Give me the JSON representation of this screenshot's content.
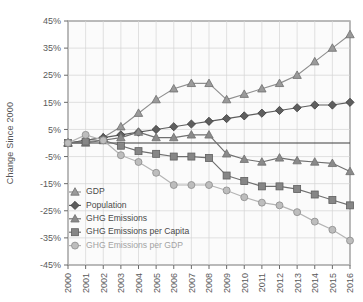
{
  "chart_data": {
    "type": "line",
    "title": "",
    "xlabel": "",
    "ylabel": "Change Since 2000",
    "ylim": [
      -45,
      45
    ],
    "ytick_step": 10,
    "ytick_labels": [
      "45%",
      "35%",
      "25%",
      "15%",
      "5%",
      "-5%",
      "-15%",
      "-25%",
      "-35%",
      "-45%"
    ],
    "ytick_values": [
      45,
      35,
      25,
      15,
      5,
      -5,
      -15,
      -25,
      -35,
      -45
    ],
    "grid": true,
    "grid_axes": "both",
    "zero_line": true,
    "legend_position": "lower-left-inside",
    "x": [
      2000,
      2001,
      2002,
      2003,
      2004,
      2005,
      2006,
      2007,
      2008,
      2009,
      2010,
      2011,
      2012,
      2013,
      2014,
      2015,
      2016
    ],
    "categories": [
      "2000",
      "2001",
      "2002",
      "2003",
      "2004",
      "2005",
      "2006",
      "2007",
      "2008",
      "2009",
      "2010",
      "2011",
      "2012",
      "2013",
      "2014",
      "2015",
      "2016"
    ],
    "series": [
      {
        "name": "GDP",
        "marker": "triangle",
        "color": "#9a9a9a",
        "line_color": "#8f8f8f",
        "values": [
          0,
          1,
          2,
          6,
          11,
          16,
          20,
          22,
          22,
          16,
          18,
          20,
          22,
          25,
          30,
          35,
          40
        ]
      },
      {
        "name": "Population",
        "marker": "diamond",
        "color": "#5e5e5e",
        "line_color": "#5e5e5e",
        "values": [
          0,
          1,
          2,
          3,
          4,
          5,
          6,
          7,
          8,
          9,
          10,
          11,
          12,
          13,
          14,
          14,
          15
        ]
      },
      {
        "name": "GHG Emissions",
        "marker": "triangle",
        "color": "#8a8a8a",
        "line_color": "#6f6f6f",
        "values": [
          0,
          0,
          1,
          2,
          4,
          2,
          2,
          3,
          3,
          -4,
          -6,
          -7,
          -5.5,
          -6.5,
          -7,
          -7.5,
          -10.5
        ]
      },
      {
        "name": "GHG Emissions per Capita",
        "marker": "square",
        "color": "#868686",
        "line_color": "#6f6f6f",
        "values": [
          0,
          0.5,
          1,
          -1,
          -3,
          -4,
          -5,
          -5,
          -5.5,
          -12,
          -14,
          -16,
          -16,
          -17,
          -19,
          -21,
          -23
        ]
      },
      {
        "name": "GHG Emissions per GDP",
        "marker": "circle",
        "color": "#bdbdbd",
        "line_color": "#b4b4b4",
        "values": [
          0,
          3,
          1,
          -4.5,
          -7,
          -11,
          -15.5,
          -15.5,
          -15.5,
          -17.5,
          -20,
          -22,
          -23,
          -25.5,
          -29,
          -32,
          -36
        ]
      }
    ]
  }
}
